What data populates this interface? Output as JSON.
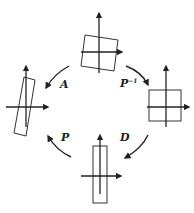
{
  "diagram": {
    "colors": {
      "stroke": "#222222",
      "background": "#ffffff"
    },
    "nodes": [
      {
        "id": "top",
        "shape": "tilted-square",
        "position": "top"
      },
      {
        "id": "right",
        "shape": "axis-aligned-square",
        "position": "right"
      },
      {
        "id": "bottom",
        "shape": "axis-aligned-tall-rectangle",
        "position": "bottom"
      },
      {
        "id": "left",
        "shape": "tilted-tall-rectangle",
        "position": "left"
      }
    ],
    "edges": [
      {
        "from": "top",
        "to": "right",
        "label": "P",
        "label_sup": "−1"
      },
      {
        "from": "right",
        "to": "bottom",
        "label": "D",
        "label_sup": ""
      },
      {
        "from": "bottom",
        "to": "left",
        "label": "P",
        "label_sup": ""
      },
      {
        "from": "top",
        "to": "left",
        "label": "A",
        "label_sup": ""
      }
    ]
  }
}
